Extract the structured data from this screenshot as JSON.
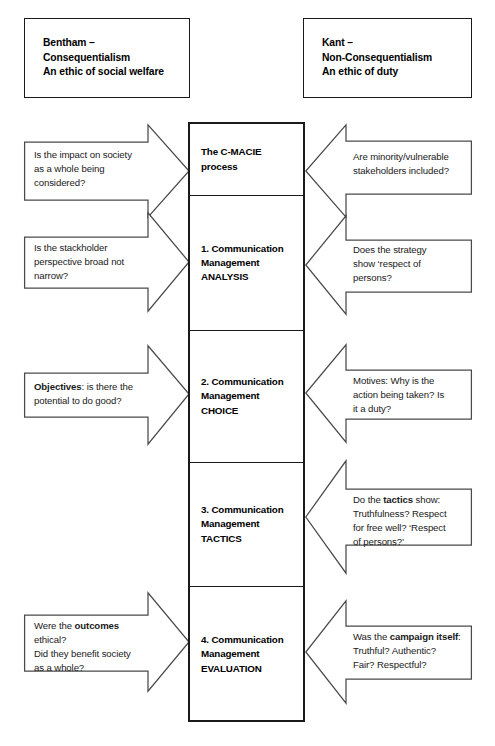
{
  "diagram": {
    "headers": [
      {
        "id": "bentham",
        "side": "left",
        "text": "Bentham –\nConsequentialism\nAn ethic of social welfare"
      },
      {
        "id": "kant",
        "side": "right",
        "text": "Kant –\nNon-Consequentialism\nAn ethic of duty"
      }
    ],
    "process_steps": [
      {
        "id": "c-macie",
        "text": "The C-MACIE\nprocess"
      },
      {
        "id": "analysis",
        "text": "1. Communication\nManagement\nANALYSIS"
      },
      {
        "id": "choice",
        "text": "2. Communication\nManagement\nCHOICE"
      },
      {
        "id": "tactics",
        "text": "3. Communication\nManagement\nTACTICS"
      },
      {
        "id": "evaluation",
        "text": "4. Communication\nManagement\nEVALUATION"
      }
    ],
    "left_arrows": [
      {
        "id": "impact-on-society",
        "html": "Is the impact on society<br>as a whole being<br>considered?"
      },
      {
        "id": "stackholder-perspective",
        "html": "Is the stackholder<br>perspective broad not<br>narrow?"
      },
      {
        "id": "objectives-potential-good",
        "html": "<b>Objectives</b>: is there the<br>potential to do good?"
      },
      {
        "id": "outcomes-ethical",
        "html": "Were the <b>outcomes</b><br>ethical?<br>Did they benefit society<br>as a whole?"
      }
    ],
    "right_arrows": [
      {
        "id": "minority-stakeholders",
        "html": "Are minority/vulnerable<br>stakeholders included?"
      },
      {
        "id": "respect-of-persons",
        "html": "Does the strategy<br>show ‘respect of<br>persons?"
      },
      {
        "id": "motives-duty",
        "html": "Motives: Why is the<br>action being taken? Is<br>it a duty?"
      },
      {
        "id": "tactics-truthfulness",
        "html": "Do the <b>tactics</b> show:<br>Truthfulness? Respect<br>for free well? ‘Respect<br>of persons?’"
      },
      {
        "id": "campaign-itself",
        "html": "Was the <b>campaign itself</b>:<br>Truthful? Authentic?<br>Fair? Respectful?"
      }
    ],
    "colors": {
      "box_border": "#1a1a1a",
      "arrow_border": "#4a4a4a",
      "background": "#ffffff",
      "text": "#1a1a1a"
    }
  }
}
